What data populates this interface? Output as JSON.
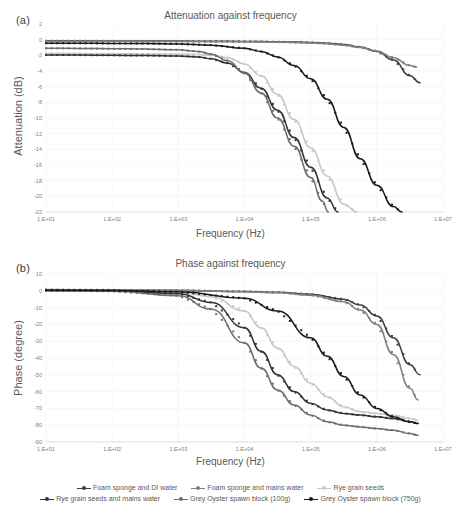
{
  "figure": {
    "panel_a_label": "(a)",
    "panel_b_label": "(b)"
  },
  "chart_data": [
    {
      "id": "attenuation",
      "type": "line",
      "title": "Attenuation against frequency",
      "xlabel": "Frequency (Hz)",
      "ylabel": "Attenuation (dB)",
      "xscale": "log",
      "xlim": [
        10,
        10000000
      ],
      "ylim": [
        -22,
        2
      ],
      "yticks": [
        2,
        0,
        -2,
        -4,
        -6,
        -8,
        -10,
        -12,
        -14,
        -16,
        -18,
        -20,
        -22
      ],
      "xticks": [
        10,
        100,
        1000,
        10000,
        100000,
        1000000,
        10000000
      ],
      "xticklabels": [
        "1.E+01",
        "1.E+02",
        "1.E+03",
        "1.E+04",
        "1.E+05",
        "1.E+06",
        "1.E+07"
      ],
      "grid": true,
      "legend_position": "bottom",
      "series": [
        {
          "name": "Foam sponge and DI water",
          "color": "#404040",
          "x": [
            10,
            31.6,
            100,
            316,
            1000,
            3160,
            10000,
            17800,
            31600,
            56200,
            100000,
            178000,
            316000,
            562000,
            1000000,
            1780000,
            3160000,
            4500000
          ],
          "values": [
            -0.15,
            -0.15,
            -0.16,
            -0.17,
            -0.18,
            -0.2,
            -0.22,
            -0.24,
            -0.27,
            -0.3,
            -0.35,
            -0.45,
            -0.62,
            -0.95,
            -1.5,
            -2.6,
            -4.6,
            -5.5
          ]
        },
        {
          "name": "Foam sponge and mains water",
          "color": "#808080",
          "x": [
            10,
            31.6,
            100,
            316,
            1000,
            3160,
            10000,
            17800,
            31600,
            56200,
            100000,
            178000,
            316000,
            562000,
            1000000,
            1780000,
            3160000,
            4000000
          ],
          "values": [
            -0.2,
            -0.2,
            -0.21,
            -0.22,
            -0.23,
            -0.25,
            -0.27,
            -0.29,
            -0.32,
            -0.36,
            -0.42,
            -0.52,
            -0.7,
            -1.0,
            -1.45,
            -2.3,
            -3.3,
            -3.5
          ]
        },
        {
          "name": "Rye grain seeds",
          "color": "#c8c8c8",
          "x": [
            10,
            31.6,
            100,
            316,
            1000,
            2000,
            3160,
            5620,
            10000,
            17800,
            31600,
            56200,
            100000,
            178000,
            316000,
            500000
          ],
          "values": [
            -1.75,
            -1.78,
            -1.8,
            -1.82,
            -1.85,
            -1.9,
            -2.0,
            -2.3,
            -3.1,
            -4.6,
            -7.0,
            -10.2,
            -13.8,
            -17.4,
            -21.0,
            -22.0
          ]
        },
        {
          "name": "Rye grain seeds and mains water",
          "color": "#333333",
          "x": [
            10,
            31.6,
            100,
            316,
            1000,
            2000,
            3160,
            5620,
            10000,
            17800,
            31600,
            56200,
            100000,
            178000,
            260000
          ],
          "values": [
            -1.95,
            -1.97,
            -2.0,
            -2.02,
            -2.08,
            -2.2,
            -2.45,
            -3.0,
            -4.2,
            -6.2,
            -9.0,
            -12.5,
            -16.3,
            -20.2,
            -22.0
          ]
        },
        {
          "name": "Grey Oyster spawn block (100g)",
          "color": "#6e6e6e",
          "x": [
            10,
            31.6,
            100,
            316,
            1000,
            2000,
            3160,
            5620,
            10000,
            17800,
            31600,
            56200,
            100000,
            150000,
            185000
          ],
          "values": [
            -1.1,
            -1.12,
            -1.15,
            -1.2,
            -1.3,
            -1.5,
            -1.85,
            -2.7,
            -4.3,
            -6.8,
            -10.0,
            -13.6,
            -17.6,
            -20.6,
            -22.0
          ]
        },
        {
          "name": "Grey Oyster spawn block (750g)",
          "color": "#1a1a1a",
          "x": [
            10,
            31.6,
            100,
            316,
            1000,
            3160,
            10000,
            17800,
            31600,
            56200,
            100000,
            178000,
            316000,
            562000,
            1000000,
            1780000,
            2400000
          ],
          "values": [
            -0.45,
            -0.46,
            -0.48,
            -0.5,
            -0.55,
            -0.7,
            -1.1,
            -1.5,
            -2.2,
            -3.3,
            -5.0,
            -7.6,
            -11.2,
            -15.2,
            -18.6,
            -21.3,
            -22.0
          ]
        }
      ]
    },
    {
      "id": "phase",
      "type": "line",
      "title": "Phase against frequency",
      "xlabel": "Frequency (Hz)",
      "ylabel": "Phase (degree)",
      "xscale": "log",
      "xlim": [
        10,
        10000000
      ],
      "ylim": [
        -90,
        10
      ],
      "yticks": [
        10,
        0,
        -10,
        -20,
        -30,
        -40,
        -50,
        -60,
        -70,
        -80,
        -90
      ],
      "xticks": [
        10,
        100,
        1000,
        10000,
        100000,
        1000000,
        10000000
      ],
      "xticklabels": [
        "1.E+01",
        "1.E+02",
        "1.E+03",
        "1.E+04",
        "1.E+05",
        "1.E+06",
        "1.E+07"
      ],
      "grid": true,
      "legend_position": "bottom",
      "series": [
        {
          "name": "Foam sponge and DI water",
          "color": "#404040",
          "x": [
            10,
            100,
            1000,
            10000,
            31600,
            100000,
            316000,
            562000,
            1000000,
            1780000,
            3160000,
            4500000
          ],
          "values": [
            0.5,
            0.4,
            0.2,
            -0.4,
            -0.9,
            -2.0,
            -5.0,
            -8.5,
            -15.0,
            -28.0,
            -44.0,
            -50.0
          ]
        },
        {
          "name": "Foam sponge and mains water",
          "color": "#808080",
          "x": [
            10,
            100,
            1000,
            10000,
            31600,
            100000,
            316000,
            562000,
            1000000,
            1780000,
            3160000,
            4200000
          ],
          "values": [
            0.7,
            0.6,
            0.3,
            -0.5,
            -1.1,
            -2.6,
            -6.5,
            -11.5,
            -20.0,
            -38.0,
            -58.0,
            -65.0
          ]
        },
        {
          "name": "Rye grain seeds",
          "color": "#c8c8c8",
          "x": [
            10,
            100,
            1000,
            3160,
            10000,
            17800,
            31600,
            56200,
            100000,
            178000,
            316000,
            562000,
            1000000,
            1780000,
            3160000,
            4200000
          ],
          "values": [
            0.2,
            0.0,
            -1.0,
            -3.5,
            -12.0,
            -22.0,
            -34.0,
            -45.0,
            -55.0,
            -63.0,
            -69.0,
            -72.0,
            -73.0,
            -74.0,
            -76.0,
            -77.0
          ]
        },
        {
          "name": "Rye grain seeds and mains water",
          "color": "#333333",
          "x": [
            10,
            100,
            1000,
            3160,
            10000,
            17800,
            31600,
            56200,
            100000,
            178000,
            316000,
            562000,
            1000000,
            1780000,
            3160000,
            4200000
          ],
          "values": [
            0.2,
            0.0,
            -1.8,
            -7.0,
            -22.0,
            -36.0,
            -50.0,
            -60.0,
            -67.0,
            -71.0,
            -73.0,
            -74.0,
            -75.0,
            -76.0,
            -78.0,
            -79.0
          ]
        },
        {
          "name": "Grey Oyster spawn block (100g)",
          "color": "#6e6e6e",
          "x": [
            10,
            100,
            1000,
            3160,
            10000,
            17800,
            31600,
            56200,
            100000,
            178000,
            316000,
            562000,
            1000000,
            1780000,
            3160000,
            4200000
          ],
          "values": [
            0.0,
            -0.3,
            -3.0,
            -11.0,
            -31.0,
            -46.0,
            -59.0,
            -68.0,
            -74.0,
            -78.0,
            -80.0,
            -81.0,
            -82.0,
            -83.0,
            -85.0,
            -86.0
          ]
        },
        {
          "name": "Grey Oyster spawn block (750g)",
          "color": "#1a1a1a",
          "x": [
            10,
            100,
            1000,
            10000,
            31600,
            100000,
            178000,
            316000,
            562000,
            1000000,
            1780000,
            3160000,
            4200000
          ],
          "values": [
            0.4,
            0.2,
            -0.6,
            -4.5,
            -12.0,
            -28.0,
            -39.0,
            -51.0,
            -62.0,
            -70.0,
            -75.0,
            -78.0,
            -79.0
          ]
        }
      ]
    }
  ],
  "legend": {
    "rows": [
      [
        {
          "label": "Foam sponge and DI water",
          "color": "#404040"
        },
        {
          "label": "Foam sponge and mains water",
          "color": "#808080"
        },
        {
          "label": "Rye grain seeds",
          "color": "#c8c8c8"
        }
      ],
      [
        {
          "label": "Rye grain seeds and mains water",
          "color": "#333333"
        },
        {
          "label": "Grey Oyster spawn block (100g)",
          "color": "#6e6e6e"
        },
        {
          "label": "Grey Oyster spawn block (750g)",
          "color": "#1a1a1a"
        }
      ]
    ]
  }
}
